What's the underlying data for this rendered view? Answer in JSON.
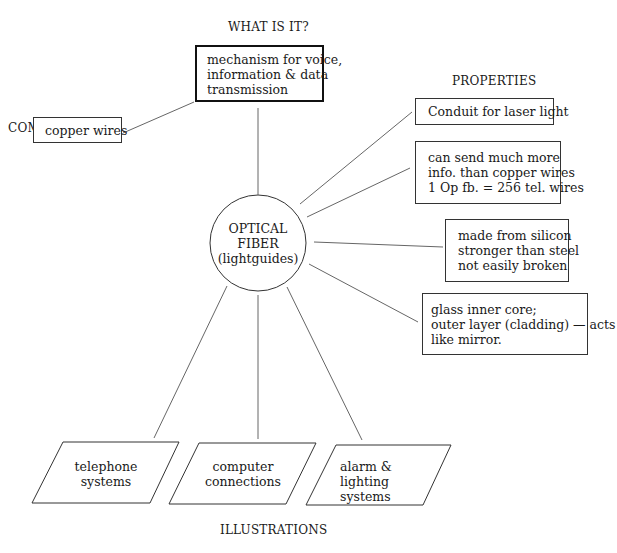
{
  "headings": {
    "what_is_it": "WHAT IS IT?",
    "comparisons": "COMPARISONS",
    "properties": "PROPERTIES",
    "illustrations": "ILLUSTRATIONS"
  },
  "center": {
    "lines": [
      "OPTICAL",
      "FIBER",
      "(lightguides)"
    ]
  },
  "definition": {
    "lines": [
      "mechanism for voice,",
      "information & data",
      "transmission"
    ]
  },
  "comparisons": [
    {
      "lines": [
        "copper wires"
      ]
    }
  ],
  "properties": [
    {
      "lines": [
        "Conduit for laser light"
      ]
    },
    {
      "lines": [
        "can send much more",
        "info. than copper wires",
        "1 Op fb. = 256 tel. wires"
      ]
    },
    {
      "lines": [
        "made from silicon",
        "stronger than steel",
        "not easily broken"
      ]
    },
    {
      "lines": [
        "glass inner core;",
        "outer layer (cladding) — acts",
        "like mirror."
      ]
    }
  ],
  "illustrations": [
    {
      "lines": [
        "telephone",
        "systems"
      ]
    },
    {
      "lines": [
        "computer",
        "connections"
      ]
    },
    {
      "lines": [
        "alarm & lighting",
        "systems"
      ]
    }
  ]
}
